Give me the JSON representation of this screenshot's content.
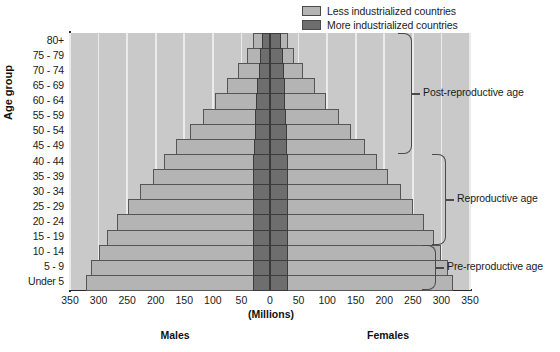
{
  "legend": {
    "items": [
      {
        "label": "Less industrialized countries",
        "color": "#b4b4b4",
        "key": "less"
      },
      {
        "label": "More industrialized countries",
        "color": "#6e6e6e",
        "key": "more"
      }
    ]
  },
  "axes": {
    "y_title": "Age group",
    "x_title": "(Millions)",
    "left_group_label": "Males",
    "right_group_label": "Females",
    "x_ticks_left": [
      "350",
      "300",
      "250",
      "200",
      "150",
      "100",
      "50"
    ],
    "x_ticks_center": "0",
    "x_ticks_right": [
      "50",
      "100",
      "150",
      "200",
      "250",
      "300",
      "350"
    ]
  },
  "annotations": [
    {
      "label": "Post-reproductive age",
      "from_group": "45 - 49",
      "to_group": "80+"
    },
    {
      "label": "Reproductive age",
      "from_group": "15 - 19",
      "to_group": "40 - 44"
    },
    {
      "label": "Pre-reproductive age",
      "from_group": "Under 5",
      "to_group": "10 - 14"
    }
  ],
  "chart_data": {
    "type": "bar",
    "subtype": "population-pyramid",
    "title": "",
    "xlabel": "(Millions)",
    "ylabel": "Age group",
    "xlim": [
      -350,
      350
    ],
    "grid": true,
    "legend_position": "top-right",
    "categories": [
      "80+",
      "75 - 79",
      "70 - 74",
      "65 - 69",
      "60 - 64",
      "55 - 59",
      "50 - 54",
      "45 - 49",
      "40 - 44",
      "35 - 39",
      "30 - 34",
      "25 - 29",
      "20 - 24",
      "15 - 19",
      "10 - 14",
      "5 - 9",
      "Under 5"
    ],
    "series": [
      {
        "name": "Less industrialized countries",
        "side": "males",
        "values": [
          30,
          40,
          56,
          76,
          96,
          118,
          140,
          164,
          186,
          205,
          228,
          248,
          268,
          285,
          300,
          313,
          322
        ]
      },
      {
        "name": "More industrialized countries",
        "side": "males",
        "values": [
          14,
          17,
          20,
          22,
          24,
          26,
          27,
          28,
          29,
          30,
          30,
          30,
          30,
          30,
          30,
          30,
          30
        ]
      },
      {
        "name": "Less industrialized countries",
        "side": "females",
        "values": [
          32,
          42,
          58,
          78,
          98,
          120,
          142,
          166,
          188,
          207,
          230,
          250,
          270,
          287,
          300,
          312,
          320
        ]
      },
      {
        "name": "More industrialized countries",
        "side": "females",
        "values": [
          20,
          22,
          24,
          26,
          27,
          28,
          29,
          30,
          31,
          32,
          32,
          32,
          32,
          32,
          32,
          32,
          32
        ]
      }
    ]
  }
}
